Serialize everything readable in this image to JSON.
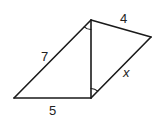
{
  "figure": {
    "stroke_color": "#1a1a1a",
    "label_color": "#222222",
    "vertices": {
      "top": [
        91,
        20
      ],
      "right": [
        151,
        37
      ],
      "bottom_left": [
        14,
        98
      ],
      "bottom_mid": [
        91,
        98
      ]
    },
    "labels": {
      "top_right_side": "4",
      "left_diagonal": "7",
      "right_diagonal": "x",
      "bottom_side": "5"
    },
    "angle_marks": [
      {
        "at": "top",
        "between": [
          "left_diagonal",
          "vertical_side"
        ]
      },
      {
        "at": "bottom_mid",
        "between": [
          "vertical_side",
          "right_diagonal"
        ]
      }
    ]
  }
}
